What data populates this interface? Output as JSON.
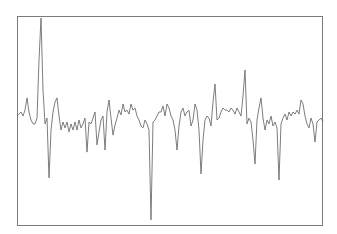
{
  "chart_data": {
    "type": "line",
    "title": "",
    "xlabel": "",
    "ylabel": "",
    "grid": false,
    "legend": null,
    "axes_visible": false,
    "frame": {
      "x0": 17,
      "y0": 16,
      "x1": 323,
      "y1": 226
    },
    "ylim": [
      0,
      100
    ],
    "xlim": [
      0,
      153
    ],
    "line_color": "#6e6e6e",
    "frame_color": "#7a7a7a",
    "series": [
      {
        "name": "signal",
        "x": [
          0,
          1,
          2,
          3,
          4,
          5,
          6,
          7,
          8,
          9,
          10,
          11,
          12,
          13,
          14,
          15,
          16,
          17,
          18,
          19,
          20,
          21,
          22,
          23,
          24,
          25,
          26,
          27,
          28,
          29,
          30,
          31,
          32,
          33,
          34,
          35,
          36,
          37,
          38,
          39,
          40,
          41,
          42,
          43,
          44,
          45,
          46,
          47,
          48,
          49,
          50,
          51,
          52,
          53,
          54,
          55,
          56,
          57,
          58,
          59,
          60,
          61,
          62,
          63,
          64,
          65,
          66,
          67,
          68,
          69,
          70,
          71,
          72,
          73,
          74,
          75,
          76,
          77,
          78,
          79,
          80,
          81,
          82,
          83,
          84,
          85,
          86,
          87,
          88,
          89,
          90,
          91,
          92,
          93,
          94,
          95,
          96,
          97,
          98,
          99,
          100,
          101,
          102,
          103,
          104,
          105,
          106,
          107,
          108,
          109,
          110,
          111,
          112,
          113,
          114,
          115,
          116,
          117,
          118,
          119,
          120,
          121,
          122,
          123,
          124,
          125,
          126,
          127,
          128,
          129,
          130,
          131,
          132,
          133,
          134,
          135,
          136,
          137,
          138,
          139,
          140,
          141,
          142,
          143,
          144,
          145,
          146,
          147,
          148,
          149,
          150,
          151,
          152,
          153
        ],
        "values": [
          52.4,
          53.3,
          54.3,
          52.4,
          55.2,
          61.0,
          54.3,
          50.5,
          48.6,
          48.6,
          51.4,
          79.0,
          99.0,
          64.8,
          48.6,
          51.4,
          22.9,
          45.7,
          54.3,
          59.0,
          61.0,
          52.4,
          45.7,
          49.5,
          46.7,
          49.5,
          44.8,
          48.6,
          45.7,
          49.5,
          45.7,
          50.5,
          46.7,
          48.6,
          51.4,
          35.2,
          49.5,
          48.6,
          51.4,
          54.3,
          38.6,
          44.8,
          50.5,
          52.4,
          36.2,
          54.3,
          60.0,
          51.4,
          43.3,
          48.1,
          51.4,
          55.2,
          52.9,
          58.1,
          54.3,
          55.2,
          53.3,
          58.1,
          55.2,
          56.2,
          52.4,
          50.5,
          47.6,
          46.7,
          50.5,
          48.6,
          45.7,
          2.9,
          49.5,
          50.5,
          52.4,
          54.3,
          54.3,
          57.1,
          52.4,
          58.1,
          56.2,
          52.4,
          50.5,
          45.7,
          36.2,
          47.6,
          54.3,
          56.2,
          52.4,
          54.3,
          55.2,
          47.6,
          50.5,
          58.1,
          55.2,
          45.7,
          24.8,
          41.0,
          50.5,
          52.4,
          51.4,
          47.6,
          59.0,
          67.6,
          50.5,
          51.4,
          54.3,
          56.2,
          55.2,
          55.2,
          54.3,
          56.2,
          55.2,
          53.3,
          56.2,
          54.3,
          52.4,
          61.9,
          74.3,
          48.6,
          51.4,
          49.5,
          41.0,
          29.5,
          50.5,
          56.2,
          61.0,
          51.4,
          45.7,
          50.5,
          48.6,
          52.4,
          47.6,
          49.5,
          46.7,
          21.9,
          48.6,
          51.4,
          53.3,
          50.5,
          54.3,
          52.4,
          54.3,
          53.3,
          55.2,
          53.3,
          60.0,
          58.1,
          52.4,
          48.6,
          46.7,
          51.4,
          48.6,
          40.0,
          49.5,
          50.5,
          51.4,
          49.5
        ]
      }
    ]
  }
}
